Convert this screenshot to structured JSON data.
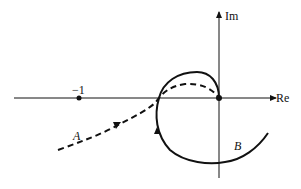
{
  "diagram": {
    "type": "nyquist-plot",
    "axes": {
      "x_label": "Re",
      "y_label": "Im"
    },
    "points": [
      {
        "label": "−1",
        "name": "critical-point"
      },
      {
        "label": "",
        "name": "origin"
      }
    ],
    "curves": [
      {
        "label": "A",
        "style": "dashed"
      },
      {
        "label": "B",
        "style": "solid"
      }
    ],
    "colors": {
      "stroke": "#111111",
      "background": "#ffffff"
    }
  }
}
